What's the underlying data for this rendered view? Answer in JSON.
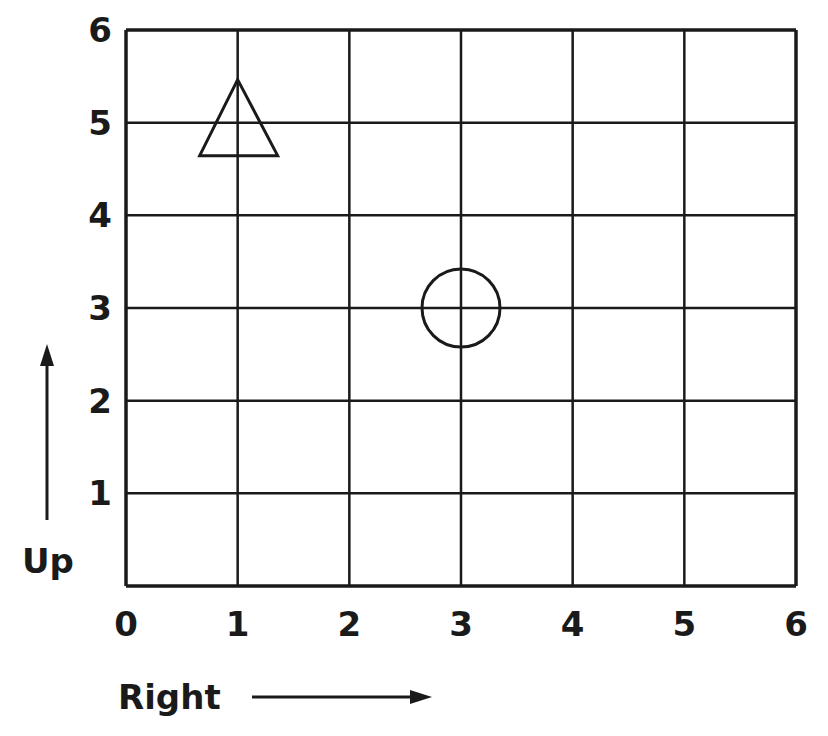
{
  "grid": {
    "x_min": 0,
    "x_max": 6,
    "y_min": 0,
    "y_max": 6,
    "x_ticks": [
      "0",
      "1",
      "2",
      "3",
      "4",
      "5",
      "6"
    ],
    "y_ticks": [
      "1",
      "2",
      "3",
      "4",
      "5",
      "6"
    ],
    "line_color": "#1a1a1a"
  },
  "axes": {
    "x_label": "Right",
    "y_label": "Up"
  },
  "shapes": [
    {
      "type": "triangle",
      "x": 1,
      "y": 5,
      "label": "triangle"
    },
    {
      "type": "circle",
      "x": 3,
      "y": 3,
      "label": "circle"
    }
  ],
  "chart_data": {
    "type": "scatter",
    "title": "",
    "xlabel": "Right",
    "ylabel": "Up",
    "xlim": [
      0,
      6
    ],
    "ylim": [
      0,
      6
    ],
    "grid": true,
    "x_ticks": [
      0,
      1,
      2,
      3,
      4,
      5,
      6
    ],
    "y_ticks": [
      1,
      2,
      3,
      4,
      5,
      6
    ],
    "series": [
      {
        "name": "triangle",
        "marker": "triangle",
        "points": [
          [
            1,
            5
          ]
        ]
      },
      {
        "name": "circle",
        "marker": "circle",
        "points": [
          [
            3,
            3
          ]
        ]
      }
    ]
  }
}
